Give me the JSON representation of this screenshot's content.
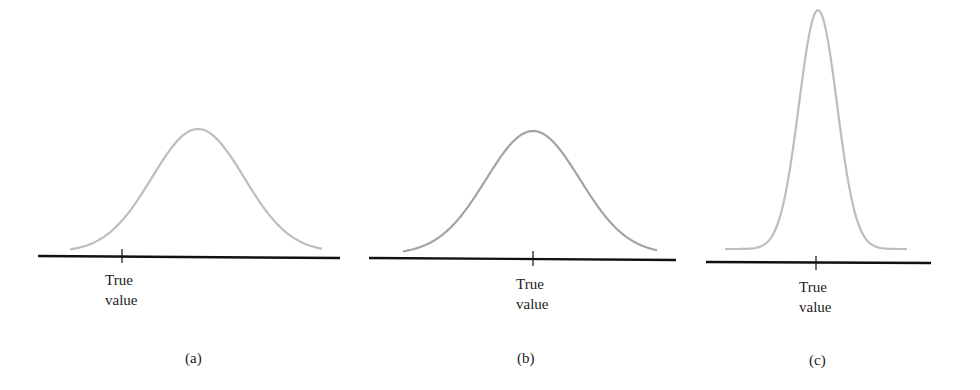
{
  "figure": {
    "panels": [
      {
        "id": "a",
        "caption": "(a)",
        "tick_label_line1": "True",
        "tick_label_line2": "value",
        "description": "Distribution offset to the right of the true value (biased, moderate spread)"
      },
      {
        "id": "b",
        "caption": "(b)",
        "tick_label_line1": "True",
        "tick_label_line2": "value",
        "description": "Distribution centered on the true value (unbiased, moderate spread)"
      },
      {
        "id": "c",
        "caption": "(c)",
        "tick_label_line1": "True",
        "tick_label_line2": "value",
        "description": "Narrow distribution centered on the true value (unbiased, small spread)"
      }
    ],
    "colors": {
      "axis": "#111111",
      "curve_a": "#bdbdbd",
      "curve_b": "#a3a3a3",
      "curve_c": "#bdbdbd",
      "text": "#222222"
    }
  },
  "chart_data": [
    {
      "type": "line",
      "title": "(a)",
      "xlabel": "",
      "ylabel": "",
      "series": [
        {
          "name": "distribution",
          "shape": "gaussian",
          "mean_px": 198,
          "peak_y_px": 129,
          "true_value_px": 122
        }
      ],
      "annotations": [
        "True value"
      ]
    },
    {
      "type": "line",
      "title": "(b)",
      "xlabel": "",
      "ylabel": "",
      "series": [
        {
          "name": "distribution",
          "shape": "gaussian",
          "mean_px": 533,
          "peak_y_px": 131,
          "true_value_px": 533
        }
      ],
      "annotations": [
        "True value"
      ]
    },
    {
      "type": "line",
      "title": "(c)",
      "xlabel": "",
      "ylabel": "",
      "series": [
        {
          "name": "distribution",
          "shape": "gaussian-narrow",
          "mean_px": 818,
          "peak_y_px": 10,
          "true_value_px": 816
        }
      ],
      "annotations": [
        "True value"
      ]
    }
  ]
}
